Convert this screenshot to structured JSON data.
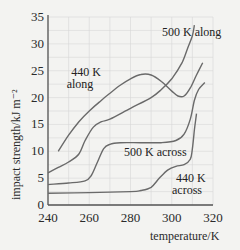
{
  "chart_data": {
    "type": "line",
    "title": "",
    "xlabel": "temperature/K",
    "ylabel": "impact strength/kJ m⁻²",
    "xlim": [
      240,
      320
    ],
    "ylim": [
      0,
      35
    ],
    "x_ticks": [
      240,
      260,
      280,
      300,
      320
    ],
    "y_ticks": [
      0,
      5,
      10,
      15,
      20,
      25,
      30,
      35
    ],
    "grid": true,
    "legend": "inline annotations",
    "series": [
      {
        "name": "440 K along",
        "label_lines": [
          "440 K",
          "along"
        ],
        "x": [
          245,
          250,
          255,
          260,
          265,
          270,
          275,
          280,
          285,
          290,
          295,
          300,
          303,
          306,
          309,
          312,
          315
        ],
        "y": [
          10,
          13,
          15.5,
          17.5,
          19.2,
          20.8,
          22.3,
          23.5,
          24.3,
          24.2,
          23,
          21.2,
          20.3,
          20.3,
          21.8,
          24.2,
          26.5
        ]
      },
      {
        "name": "500 K along",
        "label_lines": [
          "500 K along"
        ],
        "x": [
          240,
          245,
          250,
          255,
          258,
          262,
          266,
          270,
          280,
          290,
          295,
          300,
          305,
          308,
          310,
          311
        ],
        "y": [
          6,
          7,
          8,
          9.5,
          12,
          14.5,
          15.5,
          16,
          18,
          20,
          21.5,
          23.5,
          26.5,
          29.5,
          31.5,
          33.5
        ]
      },
      {
        "name": "500 K across",
        "label_lines": [
          "500 K across"
        ],
        "x": [
          240,
          250,
          258,
          261,
          264,
          267,
          270,
          275,
          285,
          295,
          302,
          306,
          309,
          311,
          313,
          316
        ],
        "y": [
          3.8,
          4.1,
          4.5,
          5.5,
          8,
          10.5,
          11.3,
          11.6,
          11.6,
          11.6,
          12,
          13.2,
          16,
          19.5,
          21.5,
          22.8
        ]
      },
      {
        "name": "440 K across",
        "label_lines": [
          "440 K",
          "across"
        ],
        "x": [
          240,
          260,
          280,
          285,
          290,
          294,
          298,
          302,
          306,
          309,
          310,
          311,
          312
        ],
        "y": [
          2.2,
          2.3,
          2.5,
          2.7,
          3.3,
          5,
          6.5,
          7.2,
          7.5,
          8.5,
          10.5,
          14,
          17
        ]
      }
    ]
  },
  "colors": {
    "background": "#f3f3f1",
    "grid": "#d6d6d6",
    "axis": "#555555",
    "curve": "#6a6a6a",
    "text": "#222222"
  }
}
